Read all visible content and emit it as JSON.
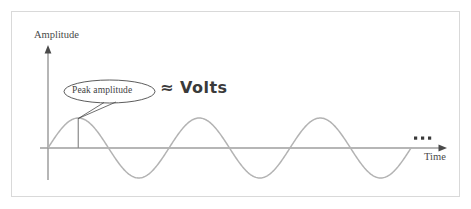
{
  "figure": {
    "type": "sine-wave-diagram",
    "frame": {
      "border_color": "#d9d9d9"
    },
    "axes": {
      "y_label": "Amplitude",
      "x_label": "Time",
      "axis_color": "#6f6f6f",
      "origin_px": [
        48,
        148
      ]
    },
    "annotations": {
      "callout_label": "Peak amplitude",
      "equation": "≈ Volts",
      "continuation": "•••"
    },
    "wave": {
      "color": "#b3b3b3",
      "cycles": 3,
      "amplitude_px": 30,
      "period_px": 121
    }
  },
  "chart_data": {
    "type": "line",
    "title": "",
    "xlabel": "Time",
    "ylabel": "Amplitude",
    "xlim": [
      0,
      3.02
    ],
    "ylim": [
      -1,
      1
    ],
    "grid": false,
    "legend": null,
    "series": [
      {
        "name": "sinusoid",
        "function": "y = A * sin(2*pi*x)",
        "color": "#b3b3b3",
        "x": [
          0,
          0.125,
          0.25,
          0.375,
          0.5,
          0.625,
          0.75,
          0.875,
          1.0,
          1.125,
          1.25,
          1.375,
          1.5,
          1.625,
          1.75,
          1.875,
          2.0,
          2.125,
          2.25,
          2.375,
          2.5,
          2.625,
          2.75,
          2.875,
          3.0
        ],
        "y": [
          0,
          0.707,
          1,
          0.707,
          0,
          -0.707,
          -1,
          -0.707,
          0,
          0.707,
          1,
          0.707,
          0,
          -0.707,
          -1,
          -0.707,
          0,
          0.707,
          1,
          0.707,
          0,
          -0.707,
          -1,
          -0.707,
          0
        ]
      }
    ],
    "annotations": [
      {
        "text": "Peak amplitude",
        "x": 0.25,
        "y": 1.0,
        "kind": "callout-oval"
      },
      {
        "text": "≈ Volts",
        "x": 0.95,
        "y": 1.9,
        "kind": "handwritten"
      },
      {
        "text": "•••",
        "x": 3.0,
        "y": 0.3,
        "kind": "ellipsis"
      }
    ],
    "markers": [
      {
        "name": "peak-amplitude-line",
        "x": 0.25,
        "y0": 0,
        "y1": 1.0
      }
    ]
  }
}
